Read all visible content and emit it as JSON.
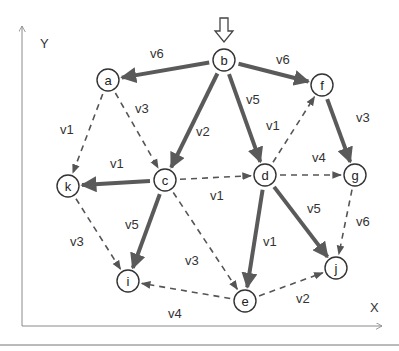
{
  "diagram": {
    "type": "directed-graph",
    "axes": {
      "x_label": "X",
      "y_label": "Y"
    },
    "start_node": "b",
    "start_marker": "hollow-down-arrow",
    "nodes": [
      {
        "id": "a",
        "label": "a",
        "x": 108,
        "y": 80
      },
      {
        "id": "b",
        "label": "b",
        "x": 224,
        "y": 60
      },
      {
        "id": "f",
        "label": "f",
        "x": 322,
        "y": 85
      },
      {
        "id": "k",
        "label": "k",
        "x": 68,
        "y": 186
      },
      {
        "id": "c",
        "label": "c",
        "x": 165,
        "y": 180
      },
      {
        "id": "d",
        "label": "d",
        "x": 265,
        "y": 175
      },
      {
        "id": "g",
        "label": "g",
        "x": 355,
        "y": 175
      },
      {
        "id": "i",
        "label": "i",
        "x": 128,
        "y": 281
      },
      {
        "id": "e",
        "label": "e",
        "x": 245,
        "y": 301
      },
      {
        "id": "j",
        "label": "j",
        "x": 336,
        "y": 268
      }
    ],
    "edges": [
      {
        "from": "b",
        "to": "a",
        "label": "v6",
        "style": "solid",
        "lx": 150,
        "ly": 58
      },
      {
        "from": "b",
        "to": "f",
        "label": "v6",
        "style": "solid",
        "lx": 276,
        "ly": 64
      },
      {
        "from": "b",
        "to": "c",
        "label": "v2",
        "style": "solid",
        "lx": 196,
        "ly": 136
      },
      {
        "from": "b",
        "to": "d",
        "label": "v5",
        "style": "solid",
        "lx": 246,
        "ly": 104
      },
      {
        "from": "a",
        "to": "k",
        "label": "v1",
        "style": "dashed",
        "lx": 60,
        "ly": 134
      },
      {
        "from": "a",
        "to": "c",
        "label": "v3",
        "style": "dashed",
        "lx": 135,
        "ly": 113
      },
      {
        "from": "d",
        "to": "f",
        "label": "v1",
        "style": "dashed",
        "lx": 266,
        "ly": 130
      },
      {
        "from": "f",
        "to": "g",
        "label": "v3",
        "style": "solid",
        "lx": 356,
        "ly": 122
      },
      {
        "from": "c",
        "to": "k",
        "label": "v1",
        "style": "solid",
        "lx": 110,
        "ly": 168
      },
      {
        "from": "c",
        "to": "d",
        "label": "v1",
        "style": "dashed",
        "lx": 210,
        "ly": 200
      },
      {
        "from": "d",
        "to": "g",
        "label": "v4",
        "style": "dashed",
        "lx": 312,
        "ly": 162
      },
      {
        "from": "c",
        "to": "i",
        "label": "v5",
        "style": "solid",
        "lx": 125,
        "ly": 229
      },
      {
        "from": "k",
        "to": "i",
        "label": "v3",
        "style": "dashed",
        "lx": 70,
        "ly": 246
      },
      {
        "from": "c",
        "to": "e",
        "label": "v3",
        "style": "dashed",
        "lx": 185,
        "ly": 265
      },
      {
        "from": "d",
        "to": "e",
        "label": "v1",
        "style": "solid",
        "lx": 263,
        "ly": 246
      },
      {
        "from": "d",
        "to": "j",
        "label": "v5",
        "style": "solid",
        "lx": 307,
        "ly": 213
      },
      {
        "from": "g",
        "to": "j",
        "label": "v6",
        "style": "dashed",
        "lx": 356,
        "ly": 226
      },
      {
        "from": "e",
        "to": "i",
        "label": "v4",
        "style": "dashed",
        "lx": 168,
        "ly": 318
      },
      {
        "from": "e",
        "to": "j",
        "label": "v2",
        "style": "dashed",
        "lx": 296,
        "ly": 303
      }
    ]
  },
  "colors": {
    "solid_edge": "#5a5a5a",
    "dashed_edge": "#555555",
    "axis": "#8a8a8a",
    "text": "#333333",
    "background": "#ffffff"
  }
}
